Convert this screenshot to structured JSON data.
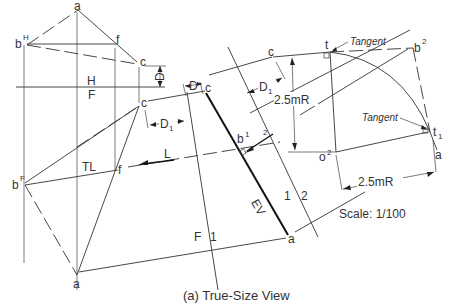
{
  "caption": "(a) True-Size View",
  "scale": "Scale: 1/100",
  "fold_lines": {
    "hf_top": "H",
    "hf_bottom": "F",
    "f1_left": "F",
    "f1_right": "1",
    "l12_left": "1",
    "l12_right": "2"
  },
  "points": {
    "a_top": "a",
    "bH": "b",
    "bH_sup": "H",
    "f_top": "f",
    "c_top": "c",
    "c_front": "c",
    "bF": "b",
    "bF_sup": "F",
    "f_front": "f",
    "a_front": "a",
    "c_view1": "c",
    "b1": "b",
    "b1_sup": "1",
    "a_view1": "a",
    "c_view2": "c",
    "t": "t",
    "b2": "b",
    "b2_sup": "2",
    "t1": "t",
    "t1_sub": "1",
    "o2": "o",
    "o2_sup": "2",
    "a_view2": "a"
  },
  "dimensions": {
    "D": "D",
    "D1_left": "D",
    "D1_left_sub": "1",
    "D1_right": "D",
    "D1_right_sub": "1",
    "radius_vertical": "2.5mR",
    "radius_horizontal": "2.5mR"
  },
  "annotations": {
    "TL": "TL",
    "L": "L",
    "EV": "EV",
    "two_mark": "2",
    "tangent_top": "Tangent",
    "tangent_right": "Tangent"
  }
}
